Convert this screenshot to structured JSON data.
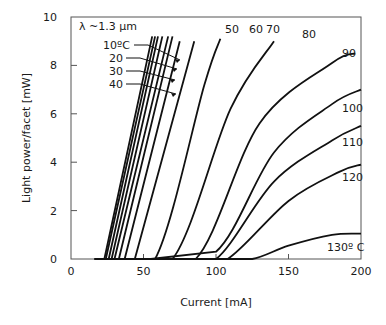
{
  "chart_data": {
    "type": "line",
    "title": "",
    "annotation": "λ ~1.3 µm",
    "xlabel": "Current [mA]",
    "ylabel": "Light power/facet [mW]",
    "xlim": [
      0,
      200
    ],
    "ylim": [
      0,
      10
    ],
    "xticks": [
      "0",
      "50",
      "100",
      "150",
      "200"
    ],
    "yticks": [
      "0",
      "2",
      "4",
      "6",
      "8",
      "10"
    ],
    "grid": false,
    "series": [
      {
        "name": "10°C",
        "label": "10ºC",
        "x": [
          16,
          23,
          56
        ],
        "y": [
          0,
          0,
          9.2
        ]
      },
      {
        "name": "20°C",
        "label": "20",
        "x": [
          17,
          24,
          58
        ],
        "y": [
          0,
          0,
          9.2
        ]
      },
      {
        "name": "30°C",
        "label": "30",
        "x": [
          18,
          26,
          60
        ],
        "y": [
          0,
          0,
          9.2
        ]
      },
      {
        "name": "40°C",
        "label": "40",
        "x": [
          19,
          28,
          63
        ],
        "y": [
          0,
          0,
          9.2
        ]
      },
      {
        "name": "45°C",
        "label": "",
        "x": [
          20,
          30,
          67
        ],
        "y": [
          0,
          0,
          9.2
        ]
      },
      {
        "name": "50°C",
        "label": "50",
        "x": [
          21,
          33,
          70
        ],
        "y": [
          0,
          0,
          9.2
        ]
      },
      {
        "name": "55°C",
        "label": "",
        "x": [
          22,
          37,
          75
        ],
        "y": [
          0,
          0,
          9.0
        ]
      },
      {
        "name": "60°C",
        "label": "60",
        "x": [
          23,
          44,
          85
        ],
        "y": [
          0,
          0,
          9.0
        ]
      },
      {
        "name": "70°C",
        "label": "70",
        "x": [
          25,
          58,
          92,
          103
        ],
        "y": [
          0,
          0,
          7.2,
          9.1
        ]
      },
      {
        "name": "80°C",
        "label": "80",
        "x": [
          28,
          70,
          110,
          140
        ],
        "y": [
          0,
          0,
          6.2,
          9.0
        ]
      },
      {
        "name": "90°C",
        "label": "90",
        "x": [
          40,
          86,
          130,
          180,
          196
        ],
        "y": [
          0,
          0,
          5.6,
          8.1,
          8.5
        ]
      },
      {
        "name": "100°C",
        "label": "100",
        "x": [
          55,
          100,
          140,
          180,
          200
        ],
        "y": [
          0,
          0.3,
          4.4,
          6.4,
          7.0
        ]
      },
      {
        "name": "110°C",
        "label": "110",
        "x": [
          70,
          100,
          140,
          180,
          200
        ],
        "y": [
          0,
          0,
          3.2,
          4.9,
          5.5
        ]
      },
      {
        "name": "120°C",
        "label": "120",
        "x": [
          85,
          108,
          150,
          185,
          200
        ],
        "y": [
          0,
          0,
          2.4,
          3.6,
          3.9
        ]
      },
      {
        "name": "130°C",
        "label": "130º C",
        "x": [
          100,
          125,
          150,
          180,
          200
        ],
        "y": [
          0,
          0,
          0.55,
          1.0,
          1.05
        ]
      }
    ]
  }
}
